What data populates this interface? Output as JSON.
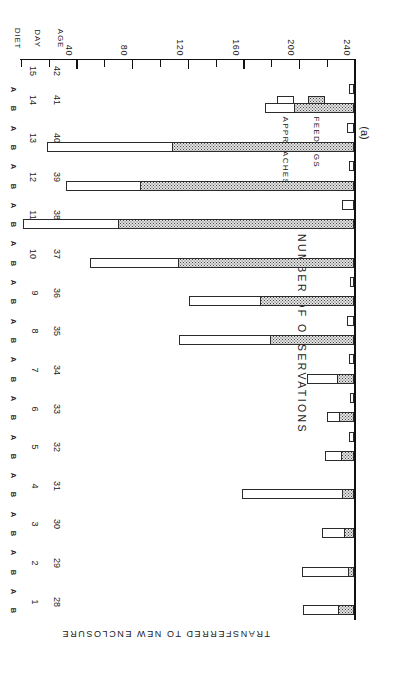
{
  "figure": {
    "panel_label": "(a)",
    "annotation": "TRANSFERRED TO NEW ENCLOSURE",
    "y_axis_title": "NUMBER OF OBSERVATIONS",
    "row_labels": {
      "diet": "DIET",
      "day": "DAY",
      "age": "AGE"
    }
  },
  "legend": {
    "items": [
      {
        "label": "FEEDINGS",
        "swatch": "stippled"
      },
      {
        "label": "APPROACHES",
        "swatch": "open"
      }
    ]
  },
  "chart_data": {
    "type": "bar",
    "orientation": "horizontal",
    "stacked": true,
    "title": "(a)",
    "xlabel": "NUMBER OF OBSERVATIONS",
    "ylabel": "DIET / DAY / AGE",
    "xlim": [
      0,
      240
    ],
    "xticks": [
      0,
      20,
      40,
      60,
      80,
      100,
      120,
      140,
      160,
      180,
      200,
      220,
      240
    ],
    "xtick_labels": [
      "",
      "",
      "40",
      "",
      "80",
      "",
      "120",
      "",
      "160",
      "",
      "200",
      "",
      "240"
    ],
    "grid": false,
    "legend_position": "inside-left",
    "annotation": "TRANSFERRED TO NEW ENCLOSURE",
    "series": [
      {
        "name": "FEEDINGS",
        "style": "stippled"
      },
      {
        "name": "APPROACHES",
        "style": "open"
      }
    ],
    "categories": [
      {
        "day": "1",
        "age": "28",
        "diet": "B",
        "feedings": 11,
        "approaches": 26
      },
      {
        "day": "1",
        "age": "28",
        "diet": "A",
        "feedings": 0,
        "approaches": 0
      },
      {
        "day": "2",
        "age": "29",
        "diet": "B",
        "feedings": 4,
        "approaches": 34
      },
      {
        "day": "2",
        "age": "29",
        "diet": "A",
        "feedings": 0,
        "approaches": 0
      },
      {
        "day": "3",
        "age": "30",
        "diet": "B",
        "feedings": 7,
        "approaches": 16
      },
      {
        "day": "3",
        "age": "30",
        "diet": "A",
        "feedings": 0,
        "approaches": 0
      },
      {
        "day": "4",
        "age": "31",
        "diet": "B",
        "feedings": 8,
        "approaches": 73
      },
      {
        "day": "4",
        "age": "31",
        "diet": "A",
        "feedings": 0,
        "approaches": 0
      },
      {
        "day": "5",
        "age": "32",
        "diet": "B",
        "feedings": 9,
        "approaches": 12
      },
      {
        "day": "5",
        "age": "32",
        "diet": "A",
        "feedings": 0,
        "approaches": 4
      },
      {
        "day": "6",
        "age": "33",
        "diet": "B",
        "feedings": 10,
        "approaches": 10
      },
      {
        "day": "6",
        "age": "33",
        "diet": "A",
        "feedings": 0,
        "approaches": 3
      },
      {
        "day": "7",
        "age": "34",
        "diet": "B",
        "feedings": 12,
        "approaches": 22
      },
      {
        "day": "7",
        "age": "34",
        "diet": "A",
        "feedings": 0,
        "approaches": 4
      },
      {
        "day": "8",
        "age": "35",
        "diet": "B",
        "feedings": 60,
        "approaches": 66
      },
      {
        "day": "8",
        "age": "35",
        "diet": "A",
        "feedings": 0,
        "approaches": 5
      },
      {
        "day": "9",
        "age": "36",
        "diet": "B",
        "feedings": 67,
        "approaches": 52
      },
      {
        "day": "9",
        "age": "36",
        "diet": "A",
        "feedings": 0,
        "approaches": 3
      },
      {
        "day": "10",
        "age": "37",
        "diet": "B",
        "feedings": 126,
        "approaches": 64
      },
      {
        "day": "10",
        "age": "37",
        "diet": "A",
        "feedings": 0,
        "approaches": 0
      },
      {
        "day": "11",
        "age": "38",
        "diet": "B",
        "feedings": 169,
        "approaches": 69
      },
      {
        "day": "11",
        "age": "38",
        "diet": "A",
        "feedings": 0,
        "approaches": 9
      },
      {
        "day": "12",
        "age": "39",
        "diet": "B",
        "feedings": 153,
        "approaches": 54
      },
      {
        "day": "12",
        "age": "39",
        "diet": "A",
        "feedings": 0,
        "approaches": 4
      },
      {
        "day": "13",
        "age": "40",
        "diet": "B",
        "feedings": 130,
        "approaches": 91
      },
      {
        "day": "13",
        "age": "40",
        "diet": "A",
        "feedings": 0,
        "approaches": 5
      },
      {
        "day": "14",
        "age": "41",
        "diet": "B",
        "feedings": 43,
        "approaches": 21
      },
      {
        "day": "14",
        "age": "41",
        "diet": "A",
        "feedings": 0,
        "approaches": 4
      },
      {
        "day": "15",
        "age": "42",
        "diet": "",
        "feedings": 0,
        "approaches": 0
      }
    ]
  }
}
